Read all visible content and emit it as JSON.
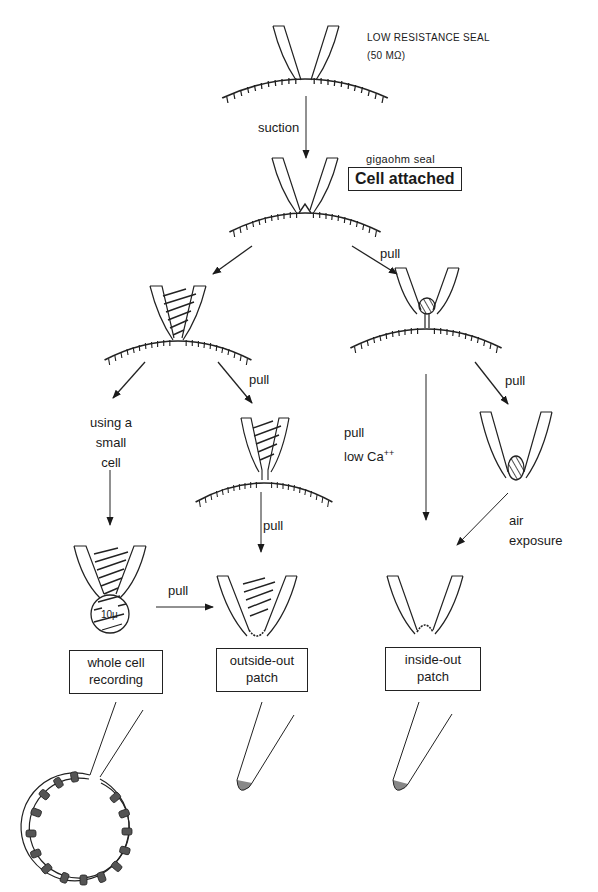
{
  "title_labels": {
    "low_seal": "LOW RESISTANCE SEAL",
    "low_seal_value": "(50 MΩ)",
    "gigaohm": "gigaohm seal",
    "cell_attached": "Cell attached"
  },
  "arrow_labels": {
    "suction": "suction",
    "pull_right_top": "pull",
    "pull_mid_left": "pull",
    "pull_mid_right": "pull",
    "using_small_cell_1": "using a",
    "using_small_cell_2": "small",
    "using_small_cell_3": "cell",
    "pull_outside": "pull",
    "pull_low_ca_1": "pull",
    "pull_low_ca_2": "low Ca",
    "pull_low_ca_sup": "++",
    "air_1": "air",
    "air_2": "exposure",
    "pull_horizontal": "pull",
    "scale": "10μ"
  },
  "configurations": [
    {
      "line1": "whole cell",
      "line2": "recording"
    },
    {
      "line1": "outside-out",
      "line2": "patch"
    },
    {
      "line1": "inside-out",
      "line2": "patch"
    }
  ]
}
